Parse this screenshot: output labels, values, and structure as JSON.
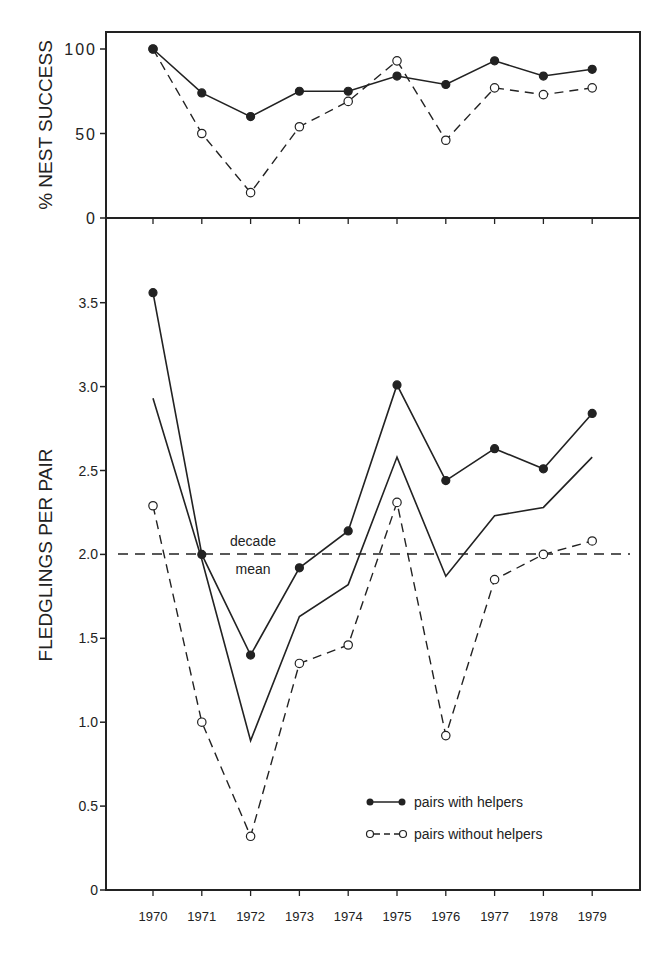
{
  "chart_data": [
    {
      "type": "line",
      "panel": "top",
      "title": "",
      "xlabel": "",
      "ylabel": "% NEST SUCCESS",
      "ylim": [
        0,
        100
      ],
      "yticks": [
        "0",
        "50",
        "100"
      ],
      "grid": false,
      "categories": [
        "1970",
        "1971",
        "1972",
        "1973",
        "1974",
        "1975",
        "1976",
        "1977",
        "1978",
        "1979"
      ],
      "series": [
        {
          "name": "pairs with helpers",
          "style": "solid-filled-markers",
          "values": [
            100,
            74,
            60,
            75,
            75,
            84,
            79,
            93,
            84,
            88
          ]
        },
        {
          "name": "pairs without helpers",
          "style": "dashed-open-markers",
          "values": [
            100,
            50,
            15,
            54,
            69,
            93,
            46,
            77,
            73,
            77
          ]
        }
      ]
    },
    {
      "type": "line",
      "panel": "bottom",
      "title": "",
      "xlabel": "",
      "ylabel": "FLEDGLINGS PER PAIR",
      "ylim": [
        0,
        3.8
      ],
      "yticks": [
        "0",
        "0.5",
        "1.0",
        "1.5",
        "2.0",
        "2.5",
        "3.0",
        "3.5"
      ],
      "grid": false,
      "categories": [
        "1970",
        "1971",
        "1972",
        "1973",
        "1974",
        "1975",
        "1976",
        "1977",
        "1978",
        "1979"
      ],
      "series": [
        {
          "name": "pairs with helpers",
          "style": "solid-filled-markers",
          "values": [
            3.56,
            2.0,
            1.4,
            1.92,
            2.14,
            3.01,
            2.44,
            2.63,
            2.51,
            2.84
          ]
        },
        {
          "name": "all pairs (unlabeled)",
          "style": "solid-no-markers",
          "values": [
            2.93,
            1.97,
            0.89,
            1.63,
            1.82,
            2.58,
            1.87,
            2.23,
            2.28,
            2.58
          ]
        },
        {
          "name": "pairs without helpers",
          "style": "dashed-open-markers",
          "values": [
            2.29,
            1.0,
            0.32,
            1.35,
            1.46,
            2.31,
            0.92,
            1.85,
            2.0,
            2.08
          ]
        }
      ],
      "reference_line": {
        "value": 2.0,
        "style": "dashed",
        "label_line1": "decade",
        "label_line2": "mean"
      },
      "legend": {
        "position": "lower-right",
        "entries": [
          {
            "label": "pairs with helpers",
            "style": "solid-filled-markers"
          },
          {
            "label": "pairs without helpers",
            "style": "dashed-open-markers"
          }
        ]
      }
    }
  ],
  "labels": {
    "top_ylabel": "% NEST SUCCESS",
    "bottom_ylabel": "FLEDGLINGS PER PAIR",
    "decade_line1": "decade",
    "decade_line2": "mean",
    "legend_helpers": "pairs with helpers",
    "legend_without": "pairs without helpers"
  },
  "colors": {
    "ink": "#222222",
    "background": "#ffffff"
  }
}
